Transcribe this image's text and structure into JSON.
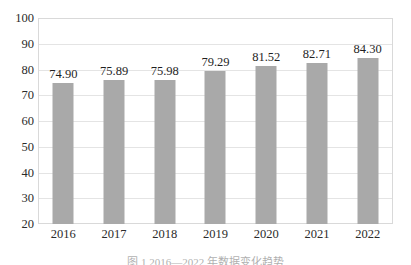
{
  "chart_data": {
    "type": "bar",
    "title": "",
    "xlabel": "",
    "ylabel": "",
    "categories": [
      "2016",
      "2017",
      "2018",
      "2019",
      "2020",
      "2021",
      "2022"
    ],
    "values": [
      74.9,
      75.89,
      75.98,
      79.29,
      81.52,
      82.71,
      84.3
    ],
    "data_labels": [
      "74.90",
      "75.89",
      "75.98",
      "79.29",
      "81.52",
      "82.71",
      "84.30"
    ],
    "ylim": [
      20,
      100
    ],
    "y_ticks": [
      20,
      30,
      40,
      50,
      60,
      70,
      80,
      90,
      100
    ],
    "y_tick_labels": [
      "20",
      "30",
      "40",
      "50",
      "60",
      "70",
      "80",
      "90",
      "100"
    ],
    "grid": "horizontal",
    "legend": "none",
    "bar_color": "#a9a9a9",
    "gridline_color": "#e4e4e4",
    "plot_border_color": "#d9d9d9",
    "text_color": "#2b2b2b"
  },
  "caption": {
    "text": "图 1  2016—2022 年数据变化趋势"
  }
}
